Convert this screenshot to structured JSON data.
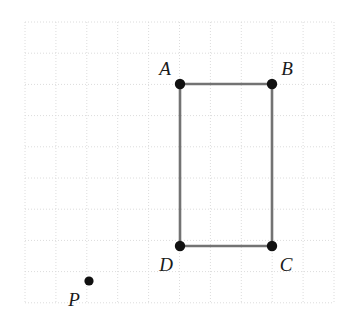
{
  "figure": {
    "kind": "geometry-diagram",
    "caption": "Rectangle ABCD with external point P on a dotted coordinate grid",
    "width": 344,
    "height": 320,
    "background_color": "#ffffff"
  },
  "grid": {
    "visible": true,
    "style": "dotted",
    "line_color": "#dcdcdc",
    "spacing_px": 30.9,
    "origin_x": 25,
    "origin_y": 22,
    "columns": 10,
    "rows": 9,
    "x_lines": [
      25,
      55.9,
      86.8,
      117.7,
      148.6,
      179.5,
      210.4,
      241.3,
      272.2,
      303.1,
      334
    ],
    "y_lines": [
      22,
      53.2,
      84.4,
      115.6,
      146.8,
      178,
      209.2,
      240.4,
      271.6,
      302.8
    ]
  },
  "shape": {
    "name": "rectangle",
    "label": "ABCD",
    "stroke_color": "#737373",
    "stroke_width": 2.6,
    "fill": "none",
    "path": "M 180 84 L 272 84 L 272 246 L 180 246 Z",
    "width_units": 3,
    "height_units": 5
  },
  "points": [
    {
      "id": "A",
      "label": "A",
      "x": 180,
      "y": 84,
      "radius": 5.2,
      "color": "#111111",
      "label_x": 165,
      "label_y": 75,
      "label_anchor": "middle",
      "label_position": "above-left"
    },
    {
      "id": "B",
      "label": "B",
      "x": 272,
      "y": 84,
      "radius": 5.2,
      "color": "#111111",
      "label_x": 287,
      "label_y": 75,
      "label_anchor": "middle",
      "label_position": "above-right"
    },
    {
      "id": "C",
      "label": "C",
      "x": 272,
      "y": 246,
      "radius": 5.2,
      "color": "#111111",
      "label_x": 286,
      "label_y": 271,
      "label_anchor": "middle",
      "label_position": "below-right"
    },
    {
      "id": "D",
      "label": "D",
      "x": 180,
      "y": 246,
      "radius": 5.2,
      "color": "#111111",
      "label_x": 166,
      "label_y": 271,
      "label_anchor": "middle",
      "label_position": "below-left"
    },
    {
      "id": "P",
      "label": "P",
      "x": 89,
      "y": 281,
      "radius": 4.6,
      "color": "#111111",
      "label_x": 74,
      "label_y": 306,
      "label_anchor": "middle",
      "label_position": "below-left"
    }
  ],
  "label_style": {
    "font_size_px": 19,
    "font_style": "italic",
    "color": "#1a1a1a"
  }
}
